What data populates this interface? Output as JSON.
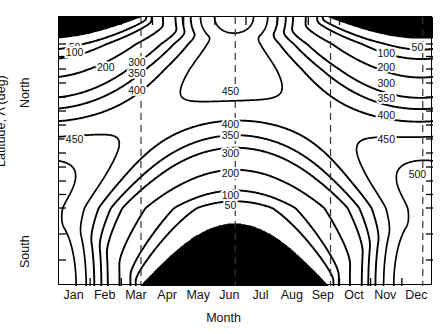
{
  "axes": {
    "x_title": "Month",
    "y_title": "Latitude, Λ (deg)",
    "y_hemisphere_north": "North",
    "y_hemisphere_south": "South",
    "x_tick_labels": [
      "Jan",
      "Feb",
      "Mar",
      "Apr",
      "May",
      "Jun",
      "Jul",
      "Aug",
      "Sep",
      "Oct",
      "Nov",
      "Dec"
    ],
    "y_tick_labels_north": [
      "90",
      "60",
      "40",
      "30",
      "20",
      "10",
      "0"
    ],
    "y_tick_labels_south": [
      "10",
      "20",
      "30",
      "40",
      "60",
      "90"
    ]
  },
  "chart_data": {
    "type": "contour",
    "title": "",
    "xlabel": "Month",
    "ylabel": "Latitude, Λ (deg)",
    "xlim": [
      "Jan",
      "Dec"
    ],
    "ylim": [
      -90,
      90
    ],
    "y_scale": "sine-latitude",
    "grid": false,
    "legend": "none",
    "x_ticks": [
      "Jan",
      "Feb",
      "Mar",
      "Apr",
      "May",
      "Jun",
      "Jul",
      "Aug",
      "Sep",
      "Oct",
      "Nov",
      "Dec"
    ],
    "y_ticks": [
      90,
      60,
      40,
      30,
      20,
      10,
      0,
      -10,
      -20,
      -30,
      -40,
      -60,
      -90
    ],
    "y_tick_text": [
      "90",
      "60",
      "40",
      "30",
      "20",
      "10",
      "0",
      "10",
      "20",
      "30",
      "40",
      "60",
      "90"
    ],
    "contour_levels": [
      50,
      100,
      200,
      300,
      350,
      400,
      450,
      500
    ],
    "units": "W/m^2 (daily mean insolation)",
    "dashed_vertical_lines": [
      "Mar 21",
      "Jun 21",
      "Sep 21",
      "Dec 21"
    ],
    "shaded_regions": [
      {
        "name": "polar-night-north",
        "months": "Oct-Feb",
        "latitudes": "66.5N-90N"
      },
      {
        "name": "polar-night-south",
        "months": "Apr-Aug",
        "latitudes": "66.5S-90S"
      }
    ],
    "contour_labels": [
      {
        "value": "50",
        "x_month": "Jan",
        "y_lat": 58,
        "region": "upper-left"
      },
      {
        "value": "100",
        "x_month": "Jan",
        "y_lat": 54,
        "region": "upper-left"
      },
      {
        "value": "200",
        "x_month": "Feb",
        "y_lat": 42,
        "region": "upper-left"
      },
      {
        "value": "300",
        "x_month": "Mar",
        "y_lat": 46,
        "region": "upper-left"
      },
      {
        "value": "350",
        "x_month": "Mar",
        "y_lat": 37,
        "region": "upper-left"
      },
      {
        "value": "400",
        "x_month": "Mar",
        "y_lat": 25,
        "region": "upper-left"
      },
      {
        "value": "450",
        "x_month": "Jun",
        "y_lat": 24,
        "region": "upper-center"
      },
      {
        "value": "400",
        "x_month": "Jun",
        "y_lat": 1,
        "region": "lower-center"
      },
      {
        "value": "350",
        "x_month": "Jun",
        "y_lat": -7,
        "region": "lower-center"
      },
      {
        "value": "300",
        "x_month": "Jun",
        "y_lat": -20,
        "region": "lower-center"
      },
      {
        "value": "200",
        "x_month": "Jun",
        "y_lat": -34,
        "region": "lower-center"
      },
      {
        "value": "100",
        "x_month": "Jun",
        "y_lat": -50,
        "region": "lower-center"
      },
      {
        "value": "50",
        "x_month": "Jun",
        "y_lat": -58,
        "region": "lower-center"
      },
      {
        "value": "450",
        "x_month": "Jan",
        "y_lat": -10,
        "region": "left-edge"
      },
      {
        "value": "450",
        "x_month": "Nov",
        "y_lat": -10,
        "region": "right-edge"
      },
      {
        "value": "500",
        "x_month": "Dec",
        "y_lat": -35,
        "region": "right-edge"
      },
      {
        "value": "50",
        "x_month": "Dec",
        "y_lat": 58,
        "region": "upper-right"
      },
      {
        "value": "100",
        "x_month": "Nov",
        "y_lat": 53,
        "region": "upper-right"
      },
      {
        "value": "200",
        "x_month": "Nov",
        "y_lat": 42,
        "region": "upper-right"
      },
      {
        "value": "300",
        "x_month": "Nov",
        "y_lat": 30,
        "region": "upper-right"
      },
      {
        "value": "350",
        "x_month": "Nov",
        "y_lat": 19,
        "region": "upper-right"
      },
      {
        "value": "400",
        "x_month": "Nov",
        "y_lat": 7,
        "region": "upper-right"
      }
    ]
  }
}
